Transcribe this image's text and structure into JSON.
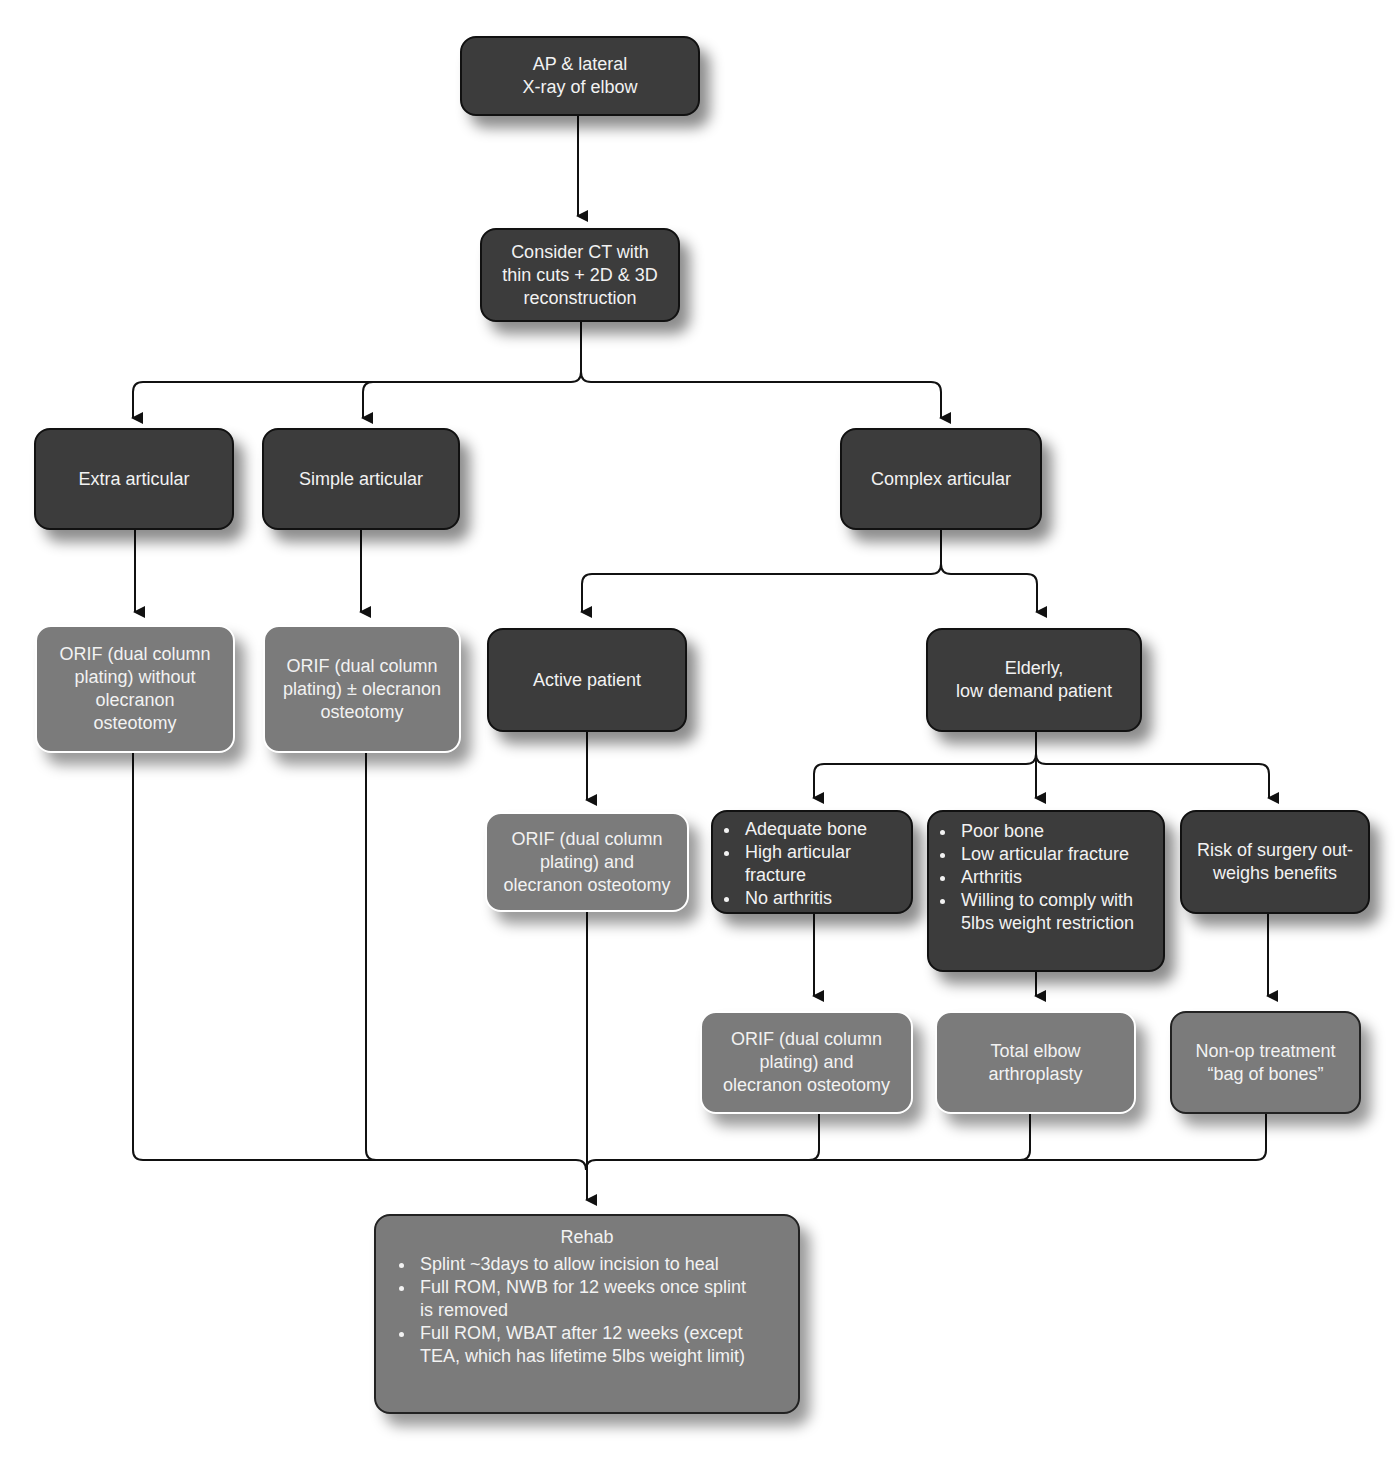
{
  "diagram": {
    "type": "flowchart",
    "header_fragment": "",
    "nodes": {
      "xray": {
        "label": "AP & lateral\nX-ray of elbow",
        "lines": [
          "AP & lateral",
          "X-ray of elbow"
        ]
      },
      "ct": {
        "lines": [
          "Consider CT with",
          "thin cuts + 2D & 3D",
          "reconstruction"
        ]
      },
      "extra_articular": {
        "label": "Extra articular"
      },
      "simple_articular": {
        "label": "Simple articular"
      },
      "complex_articular": {
        "label": "Complex articular"
      },
      "orif_without": {
        "lines": [
          "ORIF (dual column",
          "plating) without",
          "olecranon",
          "osteotomy"
        ]
      },
      "orif_plusminus": {
        "lines": [
          "ORIF (dual column",
          "plating) ± olecranon",
          "osteotomy"
        ]
      },
      "active_patient": {
        "label": "Active patient"
      },
      "elderly": {
        "lines": [
          "Elderly,",
          "low demand patient"
        ]
      },
      "orif_and_active": {
        "lines": [
          "ORIF (dual column",
          "plating) and",
          "olecranon osteotomy"
        ]
      },
      "adequate_bone": {
        "items": [
          "Adequate bone",
          "High articular fracture",
          "No arthritis"
        ]
      },
      "poor_bone": {
        "items": [
          "Poor bone",
          "Low articular fracture",
          "Arthritis",
          "Willing to comply with 5lbs weight restriction"
        ]
      },
      "risk": {
        "lines": [
          "Risk of surgery out-",
          "weighs benefits"
        ]
      },
      "orif_and_elderly": {
        "lines": [
          "ORIF (dual column",
          "plating) and",
          "olecranon osteotomy"
        ]
      },
      "tea": {
        "lines": [
          "Total elbow",
          "arthroplasty"
        ]
      },
      "nonop": {
        "lines": [
          "Non-op treatment",
          "“bag of bones”"
        ]
      },
      "rehab": {
        "title": "Rehab",
        "items": [
          "Splint ~3days to allow incision to heal",
          "Full ROM, NWB for 12 weeks once splint is removed",
          "Full ROM, WBAT after 12 weeks (except TEA, which has lifetime 5lbs weight limit)"
        ]
      }
    },
    "colors": {
      "decision_fill": "#3c3c3c",
      "treatment_fill": "#7b7b7b",
      "text": "#f2f2f2",
      "connector": "#111111"
    }
  }
}
